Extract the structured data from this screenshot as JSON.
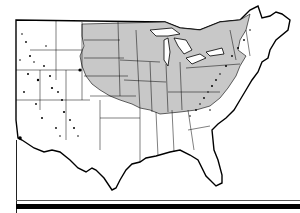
{
  "map": {
    "subject": "Contiguous United States",
    "style": "black-and-white line map with state boundaries",
    "shaded_region": {
      "label": "",
      "fill": "#c8c8c8",
      "description": "Gray-shaded area covering the central and northeastern United States"
    },
    "colors": {
      "background": "#ffffff",
      "land": "#ffffff",
      "outline": "#000000",
      "shaded": "#c8c8c8"
    },
    "features": [
      "state-boundaries",
      "great-lakes",
      "mountain-speckles-west",
      "appalachian-speckles-east"
    ]
  },
  "footer": {
    "rules": [
      "thin-rule",
      "thick-rule"
    ]
  }
}
